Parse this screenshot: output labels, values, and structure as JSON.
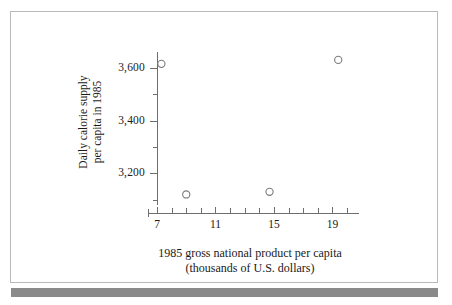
{
  "figure": {
    "background_color": "#ffffff",
    "border_color": "#b9b9b9",
    "bottom_band_color": "#8a8a8a"
  },
  "chart_data": {
    "type": "scatter",
    "title": "",
    "xlabel": "1985 gross national product per capita",
    "xlabel_line2": "(thousands of U.S. dollars)",
    "ylabel": "Daily calorie supply",
    "ylabel_line2": "per capita in 1985",
    "xlim": [
      7,
      20
    ],
    "ylim": [
      3080,
      3660
    ],
    "grid": false,
    "legend": false,
    "marker": "open-circle",
    "marker_color": "#7a7a7a",
    "axis_color": "#6e6e6e",
    "x_major_ticks": [
      7,
      11,
      15,
      19
    ],
    "x_tick_labels": [
      "7",
      "11",
      "15",
      "19"
    ],
    "x_minor_ticks": [
      8,
      9,
      10,
      12,
      13,
      14,
      16,
      17,
      18,
      20
    ],
    "y_major_ticks": [
      3200,
      3400,
      3600
    ],
    "y_tick_labels": [
      "3,200",
      "3,400",
      "3,600"
    ],
    "y_minor_ticks": [
      3100,
      3300,
      3500
    ],
    "points": [
      {
        "x": 7.3,
        "y": 3615
      },
      {
        "x": 9.0,
        "y": 3120
      },
      {
        "x": 14.7,
        "y": 3130
      },
      {
        "x": 19.4,
        "y": 3630
      }
    ]
  }
}
